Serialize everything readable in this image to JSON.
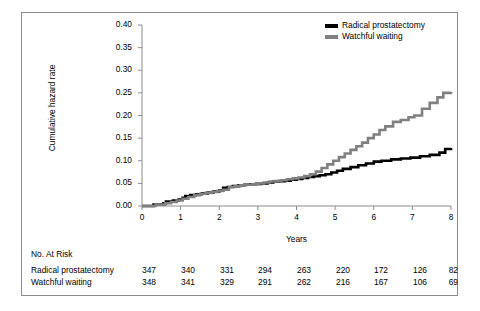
{
  "chart_data": {
    "type": "line",
    "title": "",
    "xlabel": "Years",
    "ylabel": "Cumulative hazard rate",
    "xlim": [
      0,
      8
    ],
    "ylim": [
      0.0,
      0.4
    ],
    "xticks": [
      "0",
      "1",
      "2",
      "3",
      "4",
      "5",
      "6",
      "7",
      "8"
    ],
    "yticks": [
      "0.00",
      "0.05",
      "0.10",
      "0.15",
      "0.20",
      "0.25",
      "0.30",
      "0.35",
      "0.40"
    ],
    "grid": false,
    "legend_position": "top-right",
    "series": [
      {
        "name": "Radical prostatectomy",
        "color": "#000000",
        "x": [
          0.0,
          0.3,
          0.55,
          0.62,
          0.8,
          0.95,
          1.05,
          1.12,
          1.25,
          1.4,
          1.55,
          1.7,
          1.85,
          2.0,
          2.1,
          2.22,
          2.35,
          2.5,
          2.65,
          2.8,
          2.95,
          3.1,
          3.25,
          3.4,
          3.55,
          3.7,
          3.85,
          4.0,
          4.15,
          4.3,
          4.45,
          4.6,
          4.75,
          4.9,
          5.05,
          5.2,
          5.4,
          5.6,
          5.8,
          6.0,
          6.2,
          6.45,
          6.7,
          6.95,
          7.2,
          7.45,
          7.7,
          7.85,
          8.0
        ],
        "y": [
          0.0,
          0.003,
          0.006,
          0.01,
          0.012,
          0.014,
          0.018,
          0.022,
          0.024,
          0.026,
          0.028,
          0.03,
          0.032,
          0.034,
          0.04,
          0.042,
          0.044,
          0.046,
          0.047,
          0.048,
          0.049,
          0.05,
          0.052,
          0.054,
          0.055,
          0.056,
          0.058,
          0.06,
          0.062,
          0.064,
          0.066,
          0.068,
          0.07,
          0.074,
          0.078,
          0.082,
          0.086,
          0.09,
          0.094,
          0.098,
          0.1,
          0.103,
          0.105,
          0.107,
          0.11,
          0.113,
          0.118,
          0.126,
          0.128
        ]
      },
      {
        "name": "Watchful waiting",
        "color": "#808080",
        "x": [
          0.0,
          0.35,
          0.6,
          0.75,
          0.9,
          1.05,
          1.2,
          1.35,
          1.5,
          1.65,
          1.8,
          1.95,
          2.1,
          2.25,
          2.4,
          2.55,
          2.7,
          2.85,
          3.0,
          3.15,
          3.3,
          3.45,
          3.6,
          3.75,
          3.9,
          4.05,
          4.2,
          4.35,
          4.5,
          4.65,
          4.8,
          4.95,
          5.1,
          5.25,
          5.4,
          5.55,
          5.7,
          5.85,
          6.0,
          6.15,
          6.3,
          6.5,
          6.7,
          6.9,
          7.05,
          7.25,
          7.45,
          7.65,
          7.8,
          8.0
        ],
        "y": [
          0.0,
          0.003,
          0.006,
          0.009,
          0.012,
          0.016,
          0.02,
          0.024,
          0.027,
          0.029,
          0.031,
          0.033,
          0.036,
          0.042,
          0.044,
          0.046,
          0.047,
          0.048,
          0.05,
          0.052,
          0.054,
          0.055,
          0.057,
          0.059,
          0.061,
          0.063,
          0.066,
          0.07,
          0.076,
          0.084,
          0.092,
          0.1,
          0.108,
          0.116,
          0.124,
          0.132,
          0.14,
          0.15,
          0.158,
          0.168,
          0.176,
          0.186,
          0.19,
          0.196,
          0.2,
          0.215,
          0.228,
          0.24,
          0.25,
          0.252
        ]
      }
    ]
  },
  "legend": {
    "items": [
      {
        "label": "Radical prostatectomy",
        "color": "#000000"
      },
      {
        "label": "Watchful waiting",
        "color": "#808080"
      }
    ]
  },
  "risk_table": {
    "title": "No. At Risk",
    "rows": [
      {
        "label": "Radical prostatectomy",
        "values": [
          "347",
          "340",
          "331",
          "294",
          "263",
          "220",
          "172",
          "126",
          "82"
        ]
      },
      {
        "label": "Watchful waiting",
        "values": [
          "348",
          "341",
          "329",
          "291",
          "262",
          "216",
          "167",
          "106",
          "69"
        ]
      }
    ]
  },
  "colors": {
    "series_1": "#000000",
    "series_2": "#808080",
    "axis": "#8c8c8c",
    "border": "#8c8c8c"
  }
}
